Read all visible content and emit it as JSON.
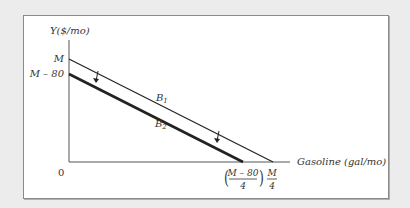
{
  "diagram": {
    "y_axis_label": "Y($/mo)",
    "x_axis_label": "Gasoline (gal/mo)",
    "origin_label": "0",
    "y_ticks": [
      "M",
      "M – 80"
    ],
    "x_ticks": [
      {
        "numerator": "M – 80",
        "denominator": "4",
        "parenthesized": true
      },
      {
        "numerator": "M",
        "denominator": "4",
        "parenthesized": false
      }
    ],
    "lines": [
      {
        "name": "B1",
        "base": "B",
        "sub": "1",
        "y_intercept": "M",
        "x_intercept": "M/4",
        "weight": "thin"
      },
      {
        "name": "B2",
        "base": "B",
        "sub": "2",
        "y_intercept": "M – 80",
        "x_intercept": "(M – 80)/4",
        "weight": "thick"
      }
    ],
    "arrows": [
      "shift-down-arrow-left",
      "shift-down-arrow-right"
    ],
    "colors": {
      "line": "#222222",
      "frame": "#8a8a8a",
      "background": "#ececec",
      "panel": "#ffffff"
    }
  }
}
